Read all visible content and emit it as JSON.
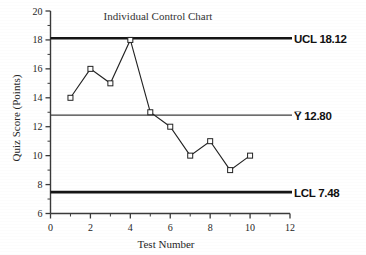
{
  "chart_data": {
    "type": "line",
    "title": "Individual Control Chart",
    "xlabel": "Test Number",
    "ylabel": "Quiz Score (Points)",
    "xlim": [
      0,
      12
    ],
    "ylim": [
      6,
      20
    ],
    "grid": false,
    "legend": "none",
    "x": [
      1,
      2,
      3,
      4,
      5,
      6,
      7,
      8,
      9,
      10
    ],
    "values": [
      14,
      16,
      15,
      18,
      13,
      12,
      10,
      11,
      9,
      10
    ],
    "series": [
      {
        "name": "Quiz Score",
        "values": [
          14,
          16,
          15,
          18,
          13,
          12,
          10,
          11,
          9,
          10
        ]
      }
    ],
    "xticks": [
      0,
      2,
      4,
      6,
      8,
      10,
      12
    ],
    "xtick_labels": [
      "0",
      "2",
      "4",
      "6",
      "8",
      "10",
      "12"
    ],
    "xminor_ticks": [
      1,
      3,
      5,
      7,
      9,
      11
    ],
    "yticks": [
      6,
      8,
      10,
      12,
      14,
      16,
      18,
      20
    ],
    "ytick_labels": [
      "6",
      "8",
      "10",
      "12",
      "14",
      "16",
      "18",
      "20"
    ],
    "yminor_ticks": [
      7,
      9,
      11,
      13,
      15,
      17,
      19
    ],
    "control_limits": [
      {
        "key": "ucl",
        "label": "UCL 18.12",
        "value": 18.12,
        "weight": "thick"
      },
      {
        "key": "center",
        "label": "Y̅ 12.80",
        "value": 12.8,
        "weight": "thin"
      },
      {
        "key": "lcl",
        "label": "LCL 7.48",
        "value": 7.48,
        "weight": "thick"
      }
    ],
    "colors": {
      "line": "#222222",
      "marker_fill": "#ffffff",
      "limit": "#151515",
      "axis": "#3a3a3a",
      "text": "#262626",
      "background": "#ffffff"
    }
  }
}
